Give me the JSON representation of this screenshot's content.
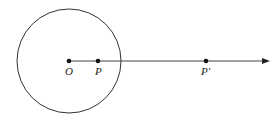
{
  "diagram": {
    "circle": {
      "cx": 69,
      "cy": 61,
      "r": 52,
      "stroke": "#333333"
    },
    "ray": {
      "x1": 69,
      "y1": 61,
      "x2": 266,
      "y2": 61,
      "stroke": "#444444"
    },
    "points": [
      {
        "id": "O",
        "label": "O",
        "x": 69,
        "y": 61
      },
      {
        "id": "P",
        "label": "P",
        "x": 98,
        "y": 61
      },
      {
        "id": "P_prime",
        "label": "P′",
        "x": 206,
        "y": 61
      }
    ]
  }
}
